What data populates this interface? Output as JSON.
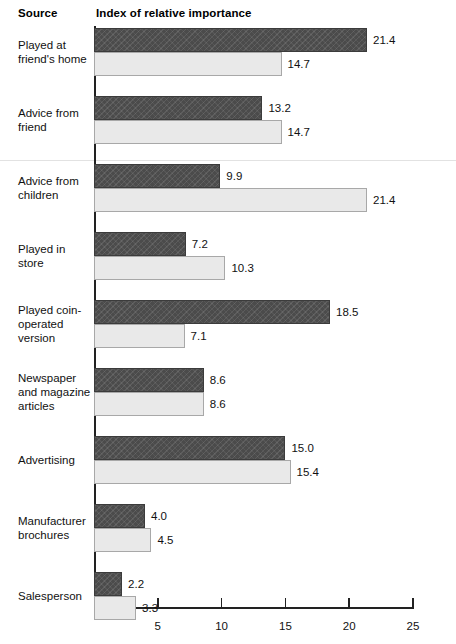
{
  "header": {
    "source_label": "Source",
    "index_label": "Index of relative importance"
  },
  "axis": {
    "tick_labels": [
      "5",
      "10",
      "15",
      "20",
      "25"
    ]
  },
  "chart_data": {
    "type": "bar",
    "title": "Index of relative importance",
    "xlabel": "Index of relative importance",
    "ylabel": "Source",
    "orientation": "horizontal",
    "grid": false,
    "legend": "none",
    "xlim": [
      0,
      25
    ],
    "xticks": [
      5,
      10,
      15,
      20,
      25
    ],
    "categories": [
      "Played at friend's home",
      "Advice from friend",
      "Advice from children",
      "Played in store",
      "Played coin-operated version",
      "Newspaper and magazine articles",
      "Advertising",
      "Manufacturer brochures",
      "Salesperson"
    ],
    "series": [
      {
        "name": "dark",
        "values": [
          21.4,
          13.2,
          9.9,
          7.2,
          18.5,
          8.6,
          15.0,
          4.0,
          2.2
        ],
        "labels": [
          "21.4",
          "13.2",
          "9.9",
          "7.2",
          "18.5",
          "8.6",
          "15.0",
          "4.0",
          "2.2"
        ],
        "color": "#4b4b4b"
      },
      {
        "name": "light",
        "values": [
          14.7,
          14.7,
          21.4,
          10.3,
          7.1,
          8.6,
          15.4,
          4.5,
          3.3
        ],
        "labels": [
          "14.7",
          "14.7",
          "21.4",
          "10.3",
          "7.1",
          "8.6",
          "15.4",
          "4.5",
          "3.3"
        ],
        "color": "#e9e9e9"
      }
    ]
  },
  "rows": [
    {
      "label_lines": [
        "Played at",
        "friend's home"
      ]
    },
    {
      "label_lines": [
        "Advice from",
        "friend"
      ]
    },
    {
      "label_lines": [
        "Advice from",
        "children"
      ]
    },
    {
      "label_lines": [
        "Played in",
        "store"
      ]
    },
    {
      "label_lines": [
        "Played coin-",
        "operated",
        "version"
      ]
    },
    {
      "label_lines": [
        "Newspaper",
        "and magazine",
        "articles"
      ]
    },
    {
      "label_lines": [
        "Advertising"
      ]
    },
    {
      "label_lines": [
        "Manufacturer",
        "brochures"
      ]
    },
    {
      "label_lines": [
        "Salesperson"
      ]
    }
  ]
}
